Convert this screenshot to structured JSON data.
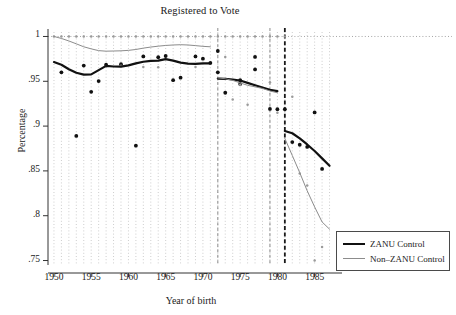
{
  "chart_data": {
    "type": "scatter",
    "title": "Registered to Vote",
    "xlabel": "Year of birth",
    "ylabel": "Percentage",
    "xlim": [
      1949.2,
      1987.6
    ],
    "ylim": [
      0.745,
      1.005
    ],
    "xticks": [
      1950,
      1955,
      1960,
      1965,
      1970,
      1975,
      1980,
      1985
    ],
    "xtick_labels": [
      "1950",
      "1955",
      "1960",
      "1965",
      "1970",
      "1975",
      "1980",
      "1985"
    ],
    "yticks": [
      1,
      0.95,
      0.9,
      0.85,
      0.8,
      0.75
    ],
    "ytick_labels": [
      "1",
      ".95",
      ".9",
      ".85",
      ".8",
      ".75"
    ],
    "grid": "dotted vertical gridlines at each year; dotted horizontal gridline at y=1",
    "legend_position": "outside right, lower",
    "reference_lines": [
      {
        "x": 1972,
        "style": "dashed",
        "color": "#8c8c8c",
        "width": 1
      },
      {
        "x": 1979,
        "style": "dashed",
        "color": "#8c8c8c",
        "width": 1
      },
      {
        "x": 1981,
        "style": "dashed",
        "color": "#1a1a1a",
        "width": 1.8
      }
    ],
    "series": [
      {
        "name": "ZANU Control",
        "role": "fitted-line",
        "color": "#111111",
        "width": 2.2,
        "segments": [
          {
            "x": [
              1950,
              1951,
              1952,
              1953,
              1954,
              1955,
              1956,
              1957,
              1958,
              1959,
              1960,
              1961,
              1962,
              1963,
              1964,
              1965,
              1966,
              1967,
              1968,
              1969,
              1970,
              1971
            ],
            "y": [
              0.9715,
              0.9685,
              0.9635,
              0.9595,
              0.9575,
              0.9577,
              0.9625,
              0.9672,
              0.9665,
              0.9663,
              0.9678,
              0.97,
              0.9718,
              0.9728,
              0.973,
              0.9748,
              0.973,
              0.9708,
              0.9698,
              0.9695,
              0.97,
              0.97
            ]
          },
          {
            "x": [
              1972,
              1973,
              1974,
              1975,
              1976,
              1977,
              1978,
              1979,
              1980
            ],
            "y": [
              0.953,
              0.9528,
              0.952,
              0.9508,
              0.9482,
              0.9455,
              0.943,
              0.9405,
              0.939
            ]
          },
          {
            "x": [
              1981,
              1982,
              1983,
              1984,
              1985,
              1986,
              1987
            ],
            "y": [
              0.8945,
              0.892,
              0.8862,
              0.8795,
              0.8722,
              0.864,
              0.8558
            ]
          }
        ],
        "points": [
          {
            "x": 1951,
            "y": 0.96
          },
          {
            "x": 1953,
            "y": 0.889
          },
          {
            "x": 1954,
            "y": 0.9675
          },
          {
            "x": 1955,
            "y": 0.9382
          },
          {
            "x": 1956,
            "y": 0.9502
          },
          {
            "x": 1957,
            "y": 0.9685
          },
          {
            "x": 1959,
            "y": 0.969
          },
          {
            "x": 1961,
            "y": 0.8782
          },
          {
            "x": 1962,
            "y": 0.9778
          },
          {
            "x": 1964,
            "y": 0.9768
          },
          {
            "x": 1965,
            "y": 0.9782
          },
          {
            "x": 1966,
            "y": 0.9512
          },
          {
            "x": 1967,
            "y": 0.954
          },
          {
            "x": 1969,
            "y": 0.9778
          },
          {
            "x": 1970,
            "y": 0.9752
          },
          {
            "x": 1971,
            "y": 0.9705
          },
          {
            "x": 1972,
            "y": 0.9838
          },
          {
            "x": 1972,
            "y": 0.96
          },
          {
            "x": 1973,
            "y": 0.9372
          },
          {
            "x": 1975,
            "y": 0.947
          },
          {
            "x": 1975,
            "y": 0.9512
          },
          {
            "x": 1977,
            "y": 0.9772
          },
          {
            "x": 1977,
            "y": 0.9632
          },
          {
            "x": 1979,
            "y": 0.9192
          },
          {
            "x": 1980,
            "y": 0.9188
          },
          {
            "x": 1981,
            "y": 0.9188
          },
          {
            "x": 1982,
            "y": 0.8822
          },
          {
            "x": 1983,
            "y": 0.8792
          },
          {
            "x": 1984,
            "y": 0.8768
          },
          {
            "x": 1985,
            "y": 0.9152
          },
          {
            "x": 1986,
            "y": 0.8522
          }
        ]
      },
      {
        "name": "Non–ZANU Control",
        "role": "fitted-line",
        "color": "#8c8c8c",
        "width": 1,
        "segments": [
          {
            "x": [
              1950,
              1951,
              1952,
              1953,
              1954,
              1955,
              1956,
              1957,
              1958,
              1959,
              1960,
              1961,
              1962,
              1963,
              1964,
              1965,
              1966,
              1967,
              1968,
              1969,
              1970,
              1971
            ],
            "y": [
              1.0,
              0.9978,
              0.995,
              0.9918,
              0.9885,
              0.9862,
              0.9842,
              0.9836,
              0.9838,
              0.984,
              0.9845,
              0.9855,
              0.987,
              0.9882,
              0.9892,
              0.99,
              0.9905,
              0.9908,
              0.9905,
              0.9898,
              0.989,
              0.9885
            ]
          },
          {
            "x": [
              1972,
              1973,
              1974,
              1975,
              1976,
              1977,
              1978,
              1979,
              1980
            ],
            "y": [
              0.9538,
              0.9528,
              0.951,
              0.9482,
              0.9455,
              0.9438,
              0.942,
              0.9392,
              0.9372
            ]
          },
          {
            "x": [
              1981,
              1982,
              1983,
              1984,
              1985,
              1986,
              1987
            ],
            "y": [
              0.8862,
              0.8672,
              0.848,
              0.8278,
              0.8098,
              0.793,
              0.785
            ]
          }
        ],
        "points": [
          {
            "x": 1950,
            "y": 1.0
          },
          {
            "x": 1951,
            "y": 1.0
          },
          {
            "x": 1952,
            "y": 1.0
          },
          {
            "x": 1953,
            "y": 1.0
          },
          {
            "x": 1954,
            "y": 1.0
          },
          {
            "x": 1955,
            "y": 1.0
          },
          {
            "x": 1956,
            "y": 1.0
          },
          {
            "x": 1957,
            "y": 1.0
          },
          {
            "x": 1958,
            "y": 1.0
          },
          {
            "x": 1959,
            "y": 1.0
          },
          {
            "x": 1960,
            "y": 1.0
          },
          {
            "x": 1961,
            "y": 1.0
          },
          {
            "x": 1962,
            "y": 1.0
          },
          {
            "x": 1963,
            "y": 1.0
          },
          {
            "x": 1964,
            "y": 1.0
          },
          {
            "x": 1965,
            "y": 1.0
          },
          {
            "x": 1966,
            "y": 1.0
          },
          {
            "x": 1967,
            "y": 1.0
          },
          {
            "x": 1968,
            "y": 1.0
          },
          {
            "x": 1969,
            "y": 1.0
          },
          {
            "x": 1970,
            "y": 1.0
          },
          {
            "x": 1971,
            "y": 1.0
          },
          {
            "x": 1972,
            "y": 1.0
          },
          {
            "x": 1973,
            "y": 1.0
          },
          {
            "x": 1974,
            "y": 1.0
          },
          {
            "x": 1975,
            "y": 1.0
          },
          {
            "x": 1976,
            "y": 1.0
          },
          {
            "x": 1977,
            "y": 1.0
          },
          {
            "x": 1978,
            "y": 1.0
          },
          {
            "x": 1979,
            "y": 1.0
          },
          {
            "x": 1980,
            "y": 1.0
          },
          {
            "x": 1981,
            "y": 1.0
          },
          {
            "x": 1957,
            "y": 0.9668
          },
          {
            "x": 1959,
            "y": 0.9672
          },
          {
            "x": 1962,
            "y": 0.966
          },
          {
            "x": 1964,
            "y": 0.9658
          },
          {
            "x": 1969,
            "y": 0.966
          },
          {
            "x": 1973,
            "y": 0.977
          },
          {
            "x": 1974,
            "y": 0.9298
          },
          {
            "x": 1975,
            "y": 0.9462
          },
          {
            "x": 1976,
            "y": 0.9238
          },
          {
            "x": 1979,
            "y": 0.9488
          },
          {
            "x": 1980,
            "y": 0.915
          },
          {
            "x": 1982,
            "y": 0.9328
          },
          {
            "x": 1983,
            "y": 0.8472
          },
          {
            "x": 1984,
            "y": 0.8338
          },
          {
            "x": 1986,
            "y": 0.7652
          },
          {
            "x": 1985,
            "y": 0.75
          }
        ]
      }
    ]
  },
  "legend": {
    "items": [
      {
        "label": "ZANU Control"
      },
      {
        "label": "Non–ZANU Control"
      }
    ]
  }
}
